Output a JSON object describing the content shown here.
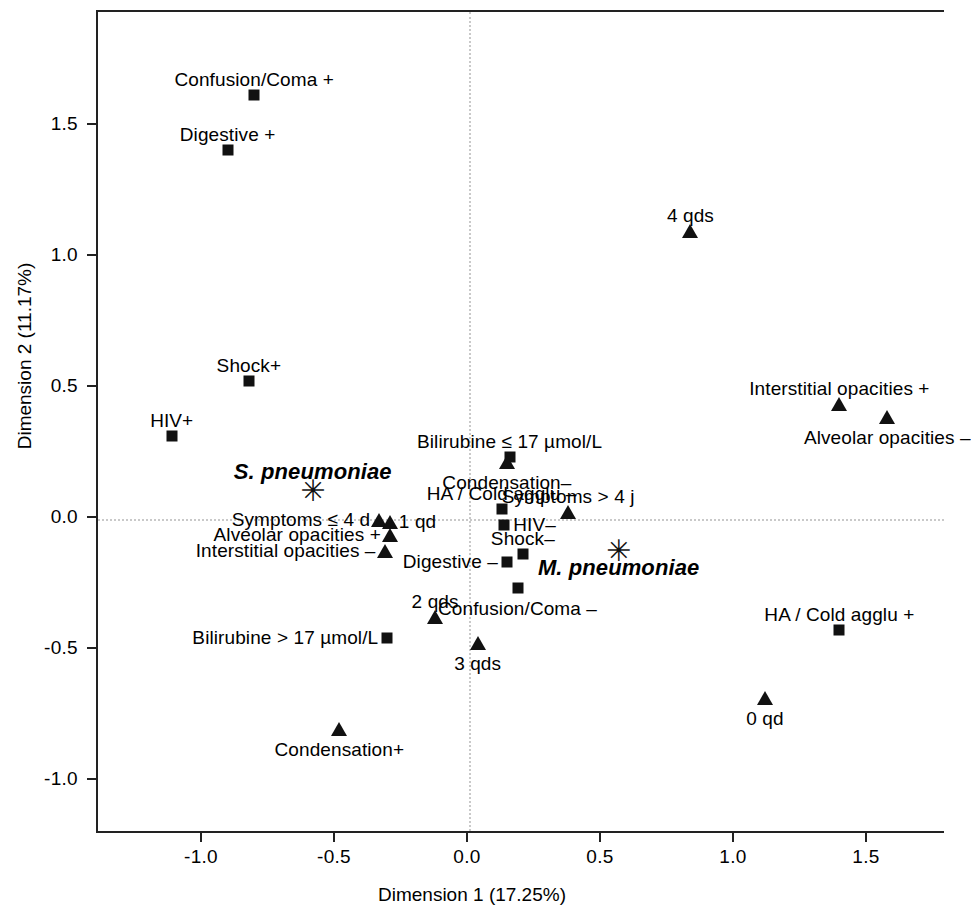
{
  "chart_data": {
    "type": "scatter",
    "title": "",
    "xlabel": "Dimension 1 (17.25%)",
    "ylabel": "Dimension 2 (11.17%)",
    "xlim": [
      -1.32,
      1.78
    ],
    "ylim": [
      -1.17,
      1.87
    ],
    "xticks": [
      "-1.0",
      "-0.5",
      "0.0",
      "0.5",
      "1.0",
      "1.5"
    ],
    "xtick_values": [
      -1.0,
      -0.5,
      0.0,
      0.5,
      1.0,
      1.5
    ],
    "yticks": [
      "1.5",
      "1.0",
      "0.5",
      "0.0",
      "-0.5",
      "-1.0"
    ],
    "ytick_values": [
      1.5,
      1.0,
      0.5,
      0.0,
      -0.5,
      -1.0
    ],
    "grid": false,
    "reference_lines": {
      "x": 0.0,
      "y": 0.0,
      "style": "dotted"
    },
    "legend": null,
    "marker_shapes": {
      "square": "symptom / clinical-sign category",
      "triangle": "radiological or severity-score category",
      "star": "pathogen (supplementary point)"
    },
    "points": [
      {
        "label": "Confusion/Coma +",
        "x": -0.8,
        "y": 1.61,
        "marker": "square",
        "label_pos": "above-center"
      },
      {
        "label": "Digestive +",
        "x": -0.9,
        "y": 1.4,
        "marker": "square",
        "label_pos": "above-center"
      },
      {
        "label": "4 qds",
        "x": 0.84,
        "y": 1.09,
        "marker": "triangle",
        "label_pos": "above-center"
      },
      {
        "label": "Shock+",
        "x": -0.82,
        "y": 0.52,
        "marker": "square",
        "label_pos": "above-center"
      },
      {
        "label": "Interstitial opacities +",
        "x": 1.4,
        "y": 0.43,
        "marker": "triangle",
        "label_pos": "above-center"
      },
      {
        "label": "HIV+",
        "x": -1.11,
        "y": 0.31,
        "marker": "square",
        "label_pos": "above-center"
      },
      {
        "label": "Alveolar opacities –",
        "x": 1.58,
        "y": 0.38,
        "marker": "triangle",
        "label_pos": "below-center"
      },
      {
        "label": "Bilirubine ≤ 17 µmol/L",
        "x": 0.16,
        "y": 0.23,
        "marker": "square",
        "label_pos": "above-center"
      },
      {
        "label": "Condensation–",
        "x": 0.15,
        "y": 0.21,
        "marker": "triangle",
        "label_pos": "below-center"
      },
      {
        "label": "S. pneumoniae",
        "x": -0.58,
        "y": 0.1,
        "marker": "star",
        "label_pos": "above-center"
      },
      {
        "label": "HA / Cold agglu –",
        "x": 0.13,
        "y": 0.03,
        "marker": "square",
        "label_pos": "above-center"
      },
      {
        "label": "Symptoms > 4 j",
        "x": 0.38,
        "y": 0.02,
        "marker": "triangle",
        "label_pos": "above-center"
      },
      {
        "label": "Symptoms ≤ 4 d",
        "x": -0.33,
        "y": -0.01,
        "marker": "triangle",
        "label_pos": "left"
      },
      {
        "label": "1 qd",
        "x": -0.29,
        "y": -0.02,
        "marker": "triangle",
        "label_pos": "right"
      },
      {
        "label": "HIV–",
        "x": 0.14,
        "y": -0.03,
        "marker": "square",
        "label_pos": "right"
      },
      {
        "label": "Alveolar opacities +",
        "x": -0.29,
        "y": -0.07,
        "marker": "triangle",
        "label_pos": "left"
      },
      {
        "label": "Shock–",
        "x": 0.21,
        "y": -0.14,
        "marker": "square",
        "label_pos": "above-center"
      },
      {
        "label": "M. pneumoniae",
        "x": 0.57,
        "y": -0.13,
        "marker": "star",
        "label_pos": "below-center"
      },
      {
        "label": "Interstitial opacities –",
        "x": -0.31,
        "y": -0.13,
        "marker": "triangle",
        "label_pos": "left"
      },
      {
        "label": "Digestive –",
        "x": 0.15,
        "y": -0.17,
        "marker": "square",
        "label_pos": "left"
      },
      {
        "label": "Confusion/Coma –",
        "x": 0.19,
        "y": -0.27,
        "marker": "square",
        "label_pos": "below-center"
      },
      {
        "label": "2 qds",
        "x": -0.12,
        "y": -0.38,
        "marker": "triangle",
        "label_pos": "above-center"
      },
      {
        "label": "HA / Cold agglu +",
        "x": 1.4,
        "y": -0.43,
        "marker": "square",
        "label_pos": "above-center"
      },
      {
        "label": "Bilirubine > 17 µmol/L",
        "x": -0.3,
        "y": -0.46,
        "marker": "square",
        "label_pos": "left"
      },
      {
        "label": "3 qds",
        "x": 0.04,
        "y": -0.48,
        "marker": "triangle",
        "label_pos": "below-center"
      },
      {
        "label": "0 qd",
        "x": 1.12,
        "y": -0.69,
        "marker": "triangle",
        "label_pos": "below-center"
      },
      {
        "label": "Condensation+",
        "x": -0.48,
        "y": -0.81,
        "marker": "triangle",
        "label_pos": "below-center"
      }
    ]
  }
}
